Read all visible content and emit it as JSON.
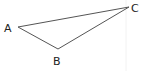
{
  "diagram": {
    "type": "triangle",
    "vertices": [
      {
        "label": "A",
        "x": 18,
        "y": 27,
        "lx": 4,
        "ly": 32
      },
      {
        "label": "B",
        "x": 58,
        "y": 49,
        "lx": 53,
        "ly": 65
      },
      {
        "label": "C",
        "x": 129,
        "y": 7,
        "lx": 131,
        "ly": 12
      }
    ],
    "stroke_color": "#555555",
    "label_color": "#222222"
  }
}
